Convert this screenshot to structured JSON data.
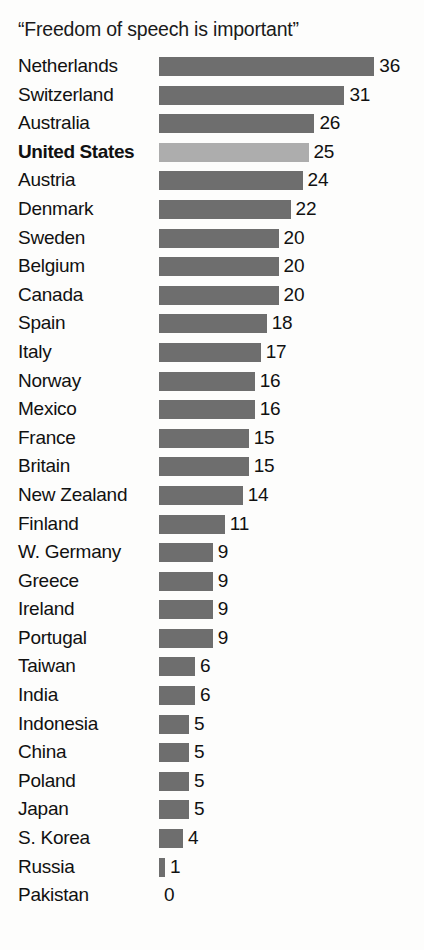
{
  "chart_data": {
    "type": "bar",
    "orientation": "horizontal",
    "title": "“Freedom of speech is important”",
    "xlabel": "",
    "ylabel": "",
    "grid": false,
    "legend": "none",
    "xlim": [
      0,
      36
    ],
    "categories": [
      "Netherlands",
      "Switzerland",
      "Australia",
      "United States",
      "Austria",
      "Denmark",
      "Sweden",
      "Belgium",
      "Canada",
      "Spain",
      "Italy",
      "Norway",
      "Mexico",
      "France",
      "Britain",
      "New Zealand",
      "Finland",
      "W. Germany",
      "Greece",
      "Ireland",
      "Portugal",
      "Taiwan",
      "India",
      "Indonesia",
      "China",
      "Poland",
      "Japan",
      "S. Korea",
      "Russia",
      "Pakistan"
    ],
    "values": [
      36,
      31,
      26,
      25,
      24,
      22,
      20,
      20,
      20,
      18,
      17,
      16,
      16,
      15,
      15,
      14,
      11,
      9,
      9,
      9,
      9,
      6,
      6,
      5,
      5,
      5,
      5,
      4,
      1,
      0
    ],
    "value_labels": [
      "36",
      "31",
      "26",
      "25",
      "24",
      "22",
      "20",
      "20",
      "20",
      "18",
      "17",
      "16",
      "16",
      "15",
      "15",
      "14",
      "11",
      "9",
      "9",
      "9",
      "9",
      "6",
      "6",
      "5",
      "5",
      "5",
      "5",
      "4",
      "1",
      "0"
    ],
    "highlighted_category": "United States",
    "colors": {
      "bar": "#6e6e6e",
      "bar_highlight": "#adadad",
      "text": "#111111",
      "background": "#fdfdfc"
    }
  }
}
